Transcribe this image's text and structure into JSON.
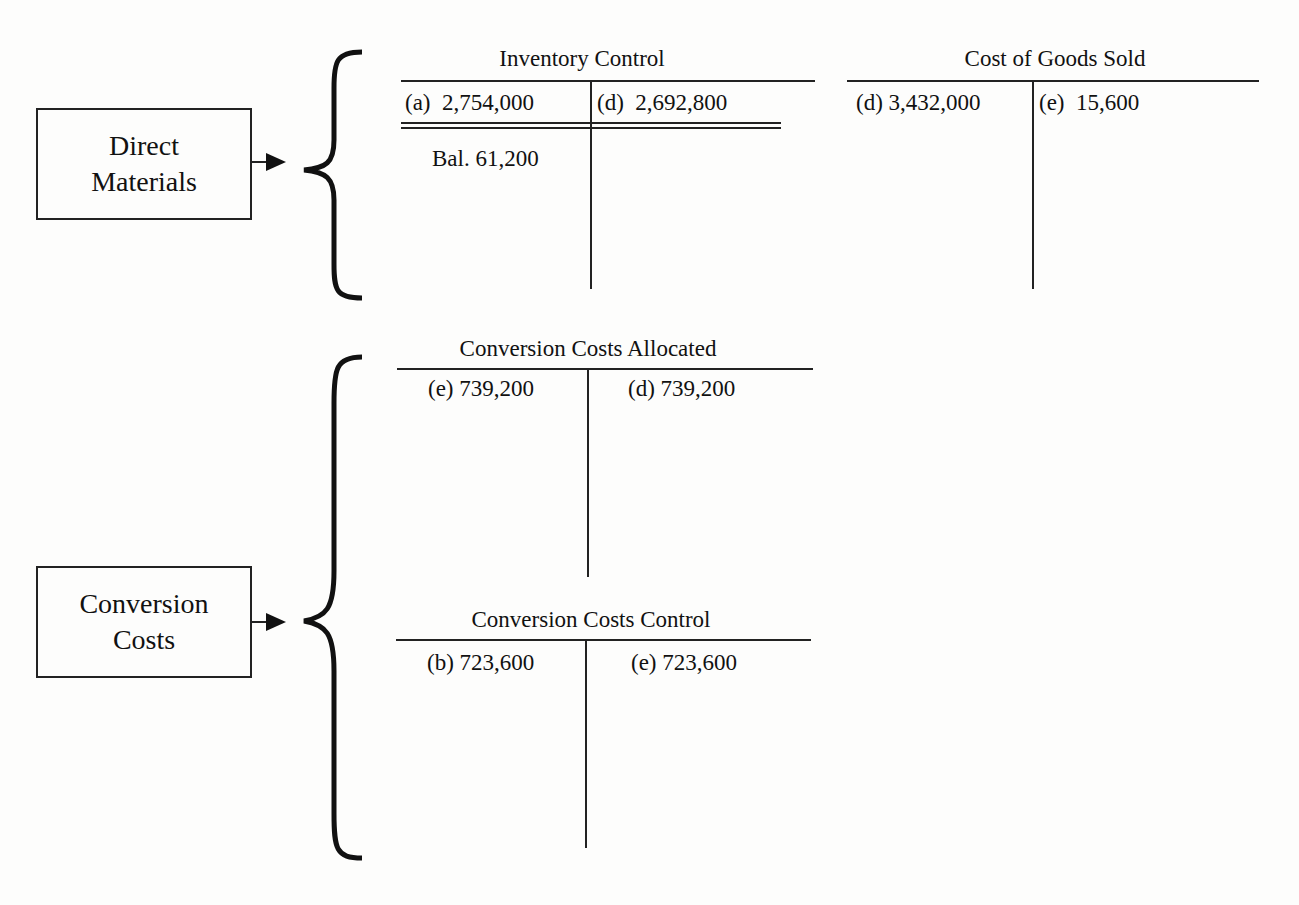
{
  "cost_categories": [
    {
      "label_line1": "Direct",
      "label_line2": "Materials"
    },
    {
      "label_line1": "Conversion",
      "label_line2": "Costs"
    }
  ],
  "accounts": {
    "inventory_control": {
      "title": "Inventory Control",
      "debits": [
        "(a)  2,754,000"
      ],
      "credits": [
        "(d)  2,692,800"
      ],
      "balance": "Bal. 61,200"
    },
    "cost_of_goods_sold": {
      "title": "Cost of Goods Sold",
      "debits": [
        "(d) 3,432,000"
      ],
      "credits": [
        "(e)  15,600"
      ]
    },
    "conversion_costs_allocated": {
      "title": "Conversion Costs Allocated",
      "debits": [
        "(e) 739,200"
      ],
      "credits": [
        "(d) 739,200"
      ]
    },
    "conversion_costs_control": {
      "title": "Conversion Costs Control",
      "debits": [
        "(b) 723,600"
      ],
      "credits": [
        "(e) 723,600"
      ]
    }
  }
}
